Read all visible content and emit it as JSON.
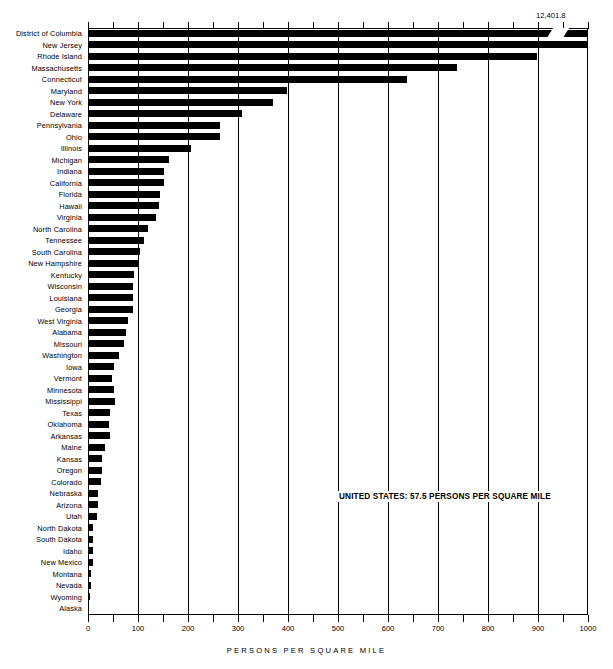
{
  "chart_data": {
    "type": "bar",
    "orientation": "horizontal",
    "title": "",
    "xlabel": "PERSONS PER SQUARE MILE",
    "ylabel": "",
    "xlim": [
      0,
      1000
    ],
    "xticks": [
      0,
      100,
      200,
      300,
      400,
      500,
      600,
      700,
      800,
      900,
      1000
    ],
    "xtick_labels": [
      "0",
      "100",
      "200",
      "300",
      "400",
      "500",
      "600",
      "700",
      "800",
      "900",
      "1000"
    ],
    "minor_tick_step": 50,
    "grid": true,
    "legend": false,
    "axis_break": {
      "category": "District of Columbia",
      "true_value": 12401.8,
      "display_label": "12,401.8"
    },
    "annotation": "UNITED STATES: 57.5 PERSONS PER SQUARE MILE",
    "categories": [
      "District of Columbia",
      "New Jersey",
      "Rhode Island",
      "Massachusetts",
      "Connecticut",
      "Maryland",
      "New York",
      "Delaware",
      "Pennsylvania",
      "Ohio",
      "Illinois",
      "Michigan",
      "Indiana",
      "California",
      "Florida",
      "Hawaii",
      "Virginia",
      "North Carolina",
      "Tennessee",
      "South Carolina",
      "New Hampshire",
      "Kentucky",
      "Wisconsin",
      "Louisiana",
      "Georgia",
      "West Virginia",
      "Alabama",
      "Missouri",
      "Washington",
      "Iowa",
      "Vermont",
      "Minnesota",
      "Mississippi",
      "Texas",
      "Oklahoma",
      "Arkansas",
      "Maine",
      "Kansas",
      "Oregon",
      "Colorado",
      "Nebraska",
      "Arizona",
      "Utah",
      "North Dakota",
      "South Dakota",
      "Idaho",
      "New Mexico",
      "Montana",
      "Nevada",
      "Wyoming",
      "Alaska"
    ],
    "values": [
      12401.8,
      1003.0,
      898.0,
      737.0,
      637.0,
      397.0,
      370.0,
      307.0,
      264.0,
      263.0,
      205.0,
      162.0,
      152.0,
      151.0,
      144.0,
      142.0,
      135.0,
      120.0,
      111.0,
      103.0,
      102.0,
      92.0,
      90.0,
      90.0,
      89.0,
      80.0,
      76.0,
      71.0,
      62.0,
      52.0,
      48.0,
      51.0,
      53.0,
      43.0,
      41.0,
      43.0,
      33.0,
      28.0,
      27.0,
      25.0,
      20.0,
      19.0,
      17.0,
      9.0,
      9.0,
      10.0,
      9.0,
      5.0,
      5.0,
      4.0,
      0.7
    ]
  },
  "units": {
    "x_axis_caption": "PERSONS PER SQUARE MILE"
  }
}
